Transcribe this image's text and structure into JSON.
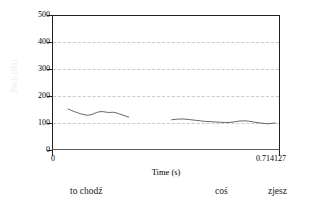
{
  "figure": {
    "name": "praat-pitch-contour",
    "background": "#ffffff",
    "frame_color": "#231f20",
    "grid_color": "#c9c9cf",
    "contour_color": "#555555",
    "yaxis_title": "Pitch (Hz)",
    "yaxis_title_color": "#ebebee"
  },
  "chart_data": {
    "type": "line",
    "title": "",
    "xlabel": "Time (s)",
    "ylabel": "Pitch (Hz)",
    "xlim": [
      0,
      0.714127
    ],
    "ylim": [
      0,
      500
    ],
    "xticks": [
      0,
      0.714127
    ],
    "xtick_labels": [
      "0",
      "0.714127"
    ],
    "yticks": [
      0,
      100,
      200,
      300,
      400,
      500
    ],
    "ytick_labels": [
      "0",
      "100",
      "200",
      "300",
      "400",
      "500"
    ],
    "grid": "horizontal-dashed",
    "gridlines_at": [
      100,
      200,
      300,
      400
    ],
    "legend": "none",
    "series": [
      {
        "name": "pitch-segment-1",
        "x": [
          0.05,
          0.06,
          0.07,
          0.08,
          0.09,
          0.1,
          0.11,
          0.12,
          0.13,
          0.14,
          0.15,
          0.16,
          0.17,
          0.18,
          0.19,
          0.2,
          0.21,
          0.22,
          0.23,
          0.24
        ],
        "values": [
          152,
          147,
          142,
          138,
          134,
          131,
          129,
          130,
          134,
          139,
          142,
          142,
          140,
          139,
          140,
          138,
          134,
          130,
          126,
          122
        ]
      },
      {
        "name": "pitch-segment-2",
        "x": [
          0.375,
          0.39,
          0.405,
          0.42,
          0.435,
          0.45,
          0.465,
          0.48,
          0.495,
          0.51,
          0.525,
          0.54,
          0.555,
          0.57,
          0.585,
          0.6,
          0.615,
          0.63,
          0.645,
          0.66,
          0.675,
          0.69,
          0.7
        ],
        "values": [
          112,
          114,
          115,
          114,
          112,
          110,
          108,
          106,
          105,
          104,
          103,
          102,
          102,
          104,
          107,
          108,
          107,
          104,
          101,
          99,
          97,
          99,
          100
        ]
      }
    ],
    "annotations": [
      {
        "name": "tier-word-1",
        "text": "to chodź",
        "x": 0.145
      },
      {
        "name": "tier-word-2",
        "text": "coś",
        "x": 0.54
      },
      {
        "name": "tier-word-3",
        "text": "zjesz",
        "x": 0.685
      }
    ]
  },
  "tier": {
    "words": [
      {
        "label": "to chodź",
        "left": 70
      },
      {
        "label": "coś",
        "left": 215
      },
      {
        "label": "zjesz",
        "left": 268
      }
    ]
  }
}
